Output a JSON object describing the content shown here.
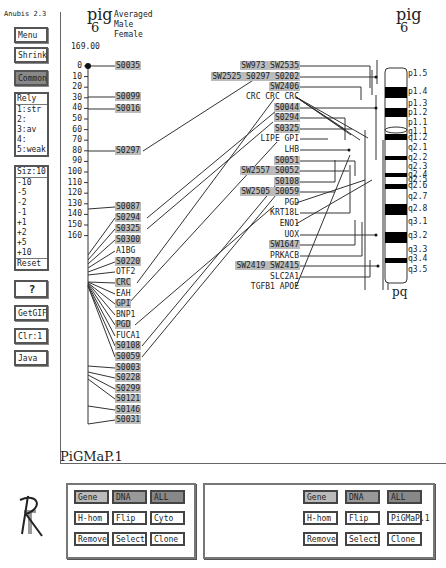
{
  "app_title": "Anubis 2.3",
  "sidebar": {
    "menu": "Menu",
    "shrink": "Shrink",
    "common": "Common",
    "rely": {
      "header": "Rely",
      "items": [
        "1:str",
        "2:",
        "3:av",
        "4:",
        "5:weak"
      ]
    },
    "size": {
      "header": "Siz:10",
      "items": [
        "-10",
        "-5",
        "-2",
        "-1",
        "+1",
        "+2",
        "+5",
        "+10"
      ],
      "reset": "Reset"
    },
    "help": "?",
    "getgif": "GetGIF",
    "clr": "Clr:1",
    "java": "Java"
  },
  "left_map": {
    "title_top": "pig",
    "title_bottom": "6",
    "legend": [
      "Averaged",
      "Male",
      "Female"
    ],
    "scale_max": "169.00",
    "ticks": [
      "0",
      "10",
      "20",
      "30",
      "40",
      "50",
      "60",
      "70",
      "80",
      "90",
      "100",
      "110",
      "120",
      "130",
      "140",
      "150",
      "160"
    ],
    "markers": [
      {
        "name": "S0035",
        "y": 66
      },
      {
        "name": "S0099",
        "y": 97
      },
      {
        "name": "S0016",
        "y": 109
      },
      {
        "name": "S0297",
        "y": 151
      },
      {
        "name": "S0087",
        "y": 207
      },
      {
        "name": "S0294",
        "y": 218
      },
      {
        "name": "S0325",
        "y": 229
      },
      {
        "name": "S0300",
        "y": 240
      },
      {
        "name": "A1BG",
        "y": 251
      },
      {
        "name": "S0220",
        "y": 262
      },
      {
        "name": "OTF2",
        "y": 272
      },
      {
        "name": "CRC",
        "y": 283
      },
      {
        "name": "EAH",
        "y": 294
      },
      {
        "name": "GPI",
        "y": 304
      },
      {
        "name": "BNP1",
        "y": 315
      },
      {
        "name": "PGD",
        "y": 325
      },
      {
        "name": "FUCA1",
        "y": 336
      },
      {
        "name": "S0108",
        "y": 346
      },
      {
        "name": "S0059",
        "y": 357
      },
      {
        "name": "S0003",
        "y": 368
      },
      {
        "name": "S0228",
        "y": 378
      },
      {
        "name": "S0299",
        "y": 389
      },
      {
        "name": "S0121",
        "y": 399
      },
      {
        "name": "S0146",
        "y": 410
      },
      {
        "name": "S0031",
        "y": 420
      }
    ]
  },
  "right_map": {
    "title_top": "pig",
    "title_bottom": "6",
    "bottom_label": "pq",
    "marker_rows": [
      {
        "text": "SW973 SW2535",
        "y": 66
      },
      {
        "text": "SW2525 S0297 S0202",
        "y": 77
      },
      {
        "text": "SW2406",
        "y": 87
      },
      {
        "text": "CRC CRC CRC",
        "y": 97
      },
      {
        "text": "S0044",
        "y": 108
      },
      {
        "text": "S0294",
        "y": 118
      },
      {
        "text": "S0325",
        "y": 129
      },
      {
        "text": "LIPE GPI",
        "y": 139
      },
      {
        "text": "LHB",
        "y": 150
      },
      {
        "text": "S0051",
        "y": 161
      },
      {
        "text": "SW2557 S0052",
        "y": 171
      },
      {
        "text": "S0108",
        "y": 182
      },
      {
        "text": "SW2505 S0059",
        "y": 192
      },
      {
        "text": "PGD",
        "y": 203
      },
      {
        "text": "KRT18L",
        "y": 213
      },
      {
        "text": "ENO1",
        "y": 224
      },
      {
        "text": "UOX",
        "y": 235
      },
      {
        "text": "SW1647",
        "y": 245
      },
      {
        "text": "PRKACB",
        "y": 256
      },
      {
        "text": "SW2419 SW2415",
        "y": 266
      },
      {
        "text": "SLC2A1",
        "y": 277
      },
      {
        "text": "TGFB1 APOE",
        "y": 287
      }
    ],
    "bands": [
      {
        "label": "p1.5",
        "y": 74
      },
      {
        "label": "p1.4",
        "y": 92
      },
      {
        "label": "p1.3",
        "y": 104
      },
      {
        "label": "p1.2",
        "y": 113
      },
      {
        "label": "p1.1",
        "y": 123
      },
      {
        "label": "q1.1",
        "y": 132
      },
      {
        "label": "q1.2",
        "y": 138
      },
      {
        "label": "q2.1",
        "y": 148
      },
      {
        "label": "q2.2",
        "y": 158
      },
      {
        "label": "q2.3",
        "y": 167
      },
      {
        "label": "q2.4",
        "y": 175
      },
      {
        "label": "q2.5",
        "y": 180
      },
      {
        "label": "q2.6",
        "y": 186
      },
      {
        "label": "q2.7",
        "y": 197
      },
      {
        "label": "q2.8",
        "y": 209
      },
      {
        "label": "q3.1",
        "y": 222
      },
      {
        "label": "q3.2",
        "y": 236
      },
      {
        "label": "q3.3",
        "y": 250
      },
      {
        "label": "q3.4",
        "y": 259
      },
      {
        "label": "q3.5",
        "y": 270
      }
    ]
  },
  "map_name": "PiGMaP.1",
  "panel_left": {
    "row1": [
      "Gene",
      "DNA",
      "ALL"
    ],
    "row2": [
      "H-hom",
      "Flip",
      "Cyto"
    ],
    "row3": [
      "Remove",
      "Select",
      "Clone"
    ]
  },
  "panel_right": {
    "row1": [
      "Gene",
      "DNA",
      "ALL"
    ],
    "row2": [
      "H-hom",
      "Flip",
      "PiGMaP.1"
    ],
    "row3": [
      "Remove",
      "Select",
      "Clone"
    ]
  }
}
